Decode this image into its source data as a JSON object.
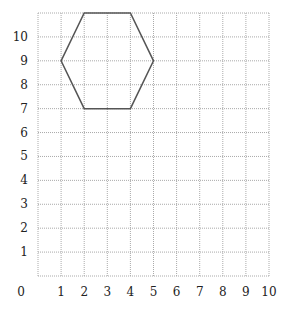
{
  "chart_data": {
    "type": "line",
    "title": "",
    "xlabel": "",
    "ylabel": "",
    "xlim": [
      0,
      10
    ],
    "ylim": [
      0,
      11
    ],
    "grid": true,
    "x_ticks": [
      "0",
      "1",
      "2",
      "3",
      "4",
      "5",
      "6",
      "7",
      "8",
      "9",
      "10"
    ],
    "y_ticks": [
      "1",
      "2",
      "3",
      "4",
      "5",
      "6",
      "7",
      "8",
      "9",
      "10"
    ],
    "shapes": [
      {
        "name": "hexagon",
        "points": [
          [
            1,
            9
          ],
          [
            2,
            11
          ],
          [
            4,
            11
          ],
          [
            5,
            9
          ],
          [
            4,
            7
          ],
          [
            2,
            7
          ]
        ],
        "closed": true,
        "color": "#555555"
      }
    ]
  }
}
